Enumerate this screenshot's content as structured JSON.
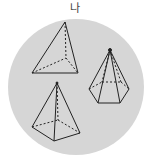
{
  "figure": {
    "label": "나",
    "background_color": "#d6d6d6",
    "line_color": "#222222",
    "shapes": [
      {
        "name": "triangular-pyramid",
        "description": "Triangular pyramid with hidden edges dashed"
      },
      {
        "name": "pentagonal-pyramid",
        "description": "Pentagonal pyramid with hidden edges dashed"
      },
      {
        "name": "square-pyramid",
        "description": "Quadrangular pyramid with hidden edges dashed"
      }
    ]
  }
}
